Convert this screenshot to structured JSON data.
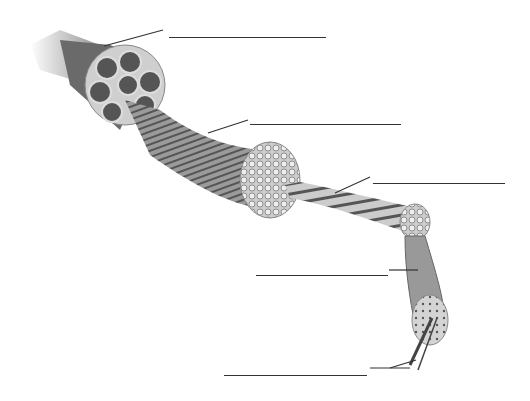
{
  "diagram": {
    "labels": [
      {
        "id": "label-1",
        "text": "",
        "line": {
          "x1": 169,
          "x2": 326,
          "y": 35
        }
      },
      {
        "id": "label-2",
        "text": "",
        "line": {
          "x1": 250,
          "x2": 401,
          "y": 122
        }
      },
      {
        "id": "label-3",
        "text": "",
        "line": {
          "x1": 373,
          "x2": 505,
          "y": 181
        }
      },
      {
        "id": "label-4",
        "text": "",
        "line": {
          "x1": 256,
          "x2": 388,
          "y": 273
        }
      },
      {
        "id": "label-5",
        "text": "",
        "line": {
          "x1": 224,
          "x2": 367,
          "y": 373
        }
      }
    ],
    "colors": {
      "line": "#333333",
      "tissue_dark": "#555555",
      "tissue_mid": "#8a8a8a",
      "tissue_light": "#bcbcbc"
    }
  }
}
